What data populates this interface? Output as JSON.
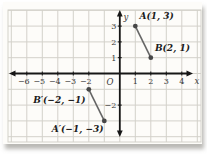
{
  "chart_data": {
    "type": "scatter",
    "title": "",
    "xlabel": "x",
    "ylabel": "y",
    "origin_label": "O",
    "xlim": [
      -7,
      5
    ],
    "ylim": [
      -4,
      4
    ],
    "grid": true,
    "legend": "none",
    "x_ticks": [
      {
        "v": -6,
        "label": "−6"
      },
      {
        "v": -5,
        "label": "−5"
      },
      {
        "v": -4,
        "label": "−4"
      },
      {
        "v": -3,
        "label": "−3"
      },
      {
        "v": -2,
        "label": "−2"
      },
      {
        "v": 1,
        "label": "1"
      },
      {
        "v": 2,
        "label": "2"
      },
      {
        "v": 3,
        "label": "3"
      },
      {
        "v": 4,
        "label": "4"
      }
    ],
    "y_ticks": [
      {
        "v": 3,
        "label": "3"
      },
      {
        "v": 2,
        "label": "2"
      },
      {
        "v": 1,
        "label": "1"
      },
      {
        "v": -2,
        "label": "−2"
      }
    ],
    "series": [
      {
        "name": "segment-AB",
        "points": [
          {
            "x": 1,
            "y": 3,
            "point_label": "A(1, 3)",
            "label_position": "upper-right"
          },
          {
            "x": 2,
            "y": 1,
            "point_label": "B(2, 1)",
            "label_position": "upper-right"
          }
        ]
      },
      {
        "name": "segment-A-prime-B-prime",
        "points": [
          {
            "x": -2,
            "y": -1,
            "point_label": "B′(−2, −1)",
            "label_position": "lower-left"
          },
          {
            "x": -1,
            "y": -3,
            "point_label": "A′(−1, −3)",
            "label_position": "below-left"
          }
        ]
      }
    ],
    "colors": {
      "grid": "#d3d1ca",
      "axis": "#161616",
      "segment": "#666666",
      "point": "#474747",
      "point_label": "#1b1b1b",
      "tick_label": "#3a3a3a",
      "figure_background": "#fdfcf9",
      "page_background": "#ffffff"
    }
  }
}
